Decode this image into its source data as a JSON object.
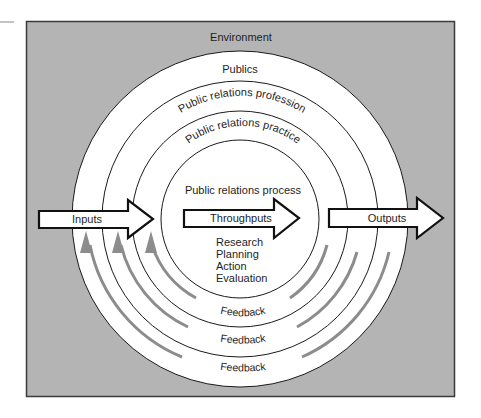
{
  "colors": {
    "environment_fill": "#b4b4b4",
    "box_border": "#3a3a3a",
    "ring_fill": "#ffffff",
    "ring_stroke": "#1a1a1a",
    "feedback_arrow": "#8c8c8c",
    "flow_arrow_fill": "#ffffff",
    "flow_arrow_stroke": "#111111",
    "text": "#1e1e1e"
  },
  "labels": {
    "environment": "Environment",
    "publics": "Publics",
    "profession": "Public relations profession",
    "practice": "Public relations practice",
    "process": "Public relations process",
    "inputs": "Inputs",
    "throughputs": "Throughputs",
    "outputs": "Outputs",
    "process_steps": [
      "Research",
      "Planning",
      "Action",
      "Evaluation"
    ],
    "feedback": [
      "Feedback",
      "Feedback",
      "Feedback"
    ]
  }
}
